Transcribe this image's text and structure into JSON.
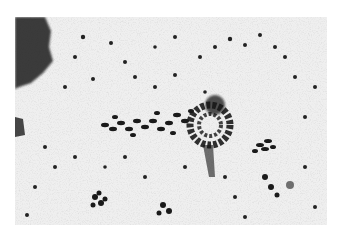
{
  "image": {
    "kind": "grayscale photomicrograph",
    "description": "Histological section showing a dense central cluster of dark-stained cell nuclei with a band of elongated nuclei extending to the left, a dark irregular stained mass at the upper-left corner, and scattered dark nuclei across a pale, finely granular background.",
    "colors": {
      "background": "#ffffff",
      "tissue": "#ececec",
      "stain_dark": "#1a1a1a",
      "stain_mid": "#555555"
    }
  }
}
